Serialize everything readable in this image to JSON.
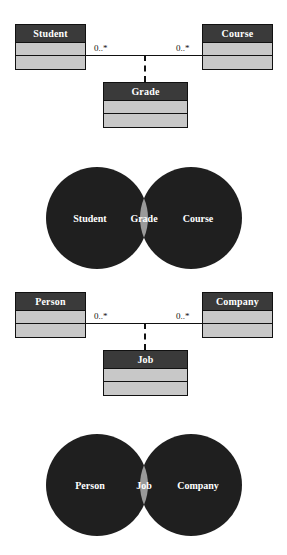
{
  "colors": {
    "class_header_bg": "#3a3a3a",
    "class_body_bg": "#c8c8c8",
    "border": "#111111",
    "header_text": "#ffffff",
    "venn_circle": "#1f1f1f",
    "venn_intersection": "#9a9a9a",
    "venn_text": "#ffffff",
    "page_bg": "#ffffff"
  },
  "diagrams": [
    {
      "id": "student-course-grade",
      "left_class": {
        "name": "Student",
        "compartments": [
          "",
          ""
        ]
      },
      "right_class": {
        "name": "Course",
        "compartments": [
          "",
          ""
        ]
      },
      "association_class": {
        "name": "Grade",
        "compartments": [
          "",
          ""
        ]
      },
      "left_multiplicity": "0..*",
      "right_multiplicity": "0..*",
      "link_style": "dashed"
    },
    {
      "id": "person-company-job",
      "left_class": {
        "name": "Person",
        "compartments": [
          "",
          ""
        ]
      },
      "right_class": {
        "name": "Company",
        "compartments": [
          "",
          ""
        ]
      },
      "association_class": {
        "name": "Job",
        "compartments": [
          "",
          ""
        ]
      },
      "left_multiplicity": "0..*",
      "right_multiplicity": "0..*",
      "link_style": "dashed"
    }
  ],
  "venns": [
    {
      "id": "venn-student-course",
      "left_label": "Student",
      "right_label": "Course",
      "intersection_label": "Grade"
    },
    {
      "id": "venn-person-company",
      "left_label": "Person",
      "right_label": "Company",
      "intersection_label": "Job"
    }
  ]
}
